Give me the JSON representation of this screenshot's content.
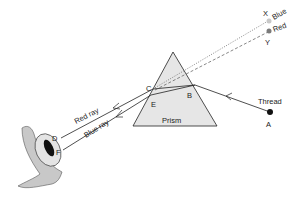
{
  "labels": {
    "prism": "Prism",
    "thread": "Thread",
    "point_a": "A",
    "point_b": "B",
    "point_c": "C",
    "point_e": "E",
    "point_d": "D",
    "point_f": "F",
    "point_x": "X",
    "point_y": "Y",
    "blue": "Blue",
    "red": "Red",
    "red_ray": "Red ray",
    "blue_ray": "Blue ray"
  },
  "colors": {
    "prism_fill": "#e6e6e6",
    "line": "#222222",
    "blue_dot": "#c8c8c8",
    "red_dot": "#7a7a7a",
    "eye_fill": "#d6d6d6",
    "pupil": "#111111"
  }
}
